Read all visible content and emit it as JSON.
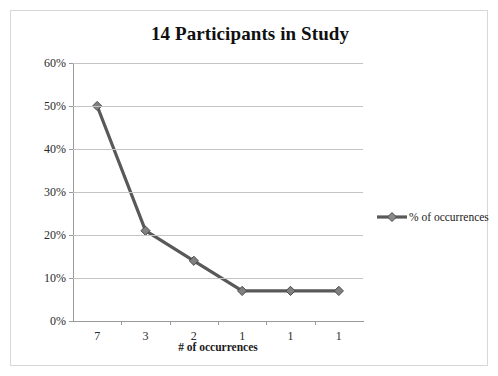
{
  "chart_data": {
    "type": "line",
    "title": "14 Participants in Study",
    "xlabel": "# of occurrences",
    "ylabel": "% of occurrences",
    "categories": [
      "7",
      "3",
      "2",
      "1",
      "1",
      "1"
    ],
    "series": [
      {
        "name": "% of occurrences",
        "values": [
          50,
          21,
          14,
          7,
          7,
          7
        ]
      }
    ],
    "ylim": [
      0,
      60
    ],
    "ytick_labels": [
      "0%",
      "10%",
      "20%",
      "30%",
      "40%",
      "50%",
      "60%"
    ],
    "ytick_values": [
      0,
      10,
      20,
      30,
      40,
      50,
      60
    ],
    "grid": "horizontal",
    "legend_position": "right",
    "marker": "diamond",
    "colors": {
      "series_line": "#595959",
      "marker_fill": "#808080",
      "gridline": "#c4c4c4",
      "axis": "#9a9a9a",
      "text": "#1a1a1a",
      "frame_border": "#d8d8d8",
      "background": "#ffffff"
    }
  },
  "legend": {
    "entries": [
      {
        "label": "% of occurrences"
      }
    ]
  }
}
